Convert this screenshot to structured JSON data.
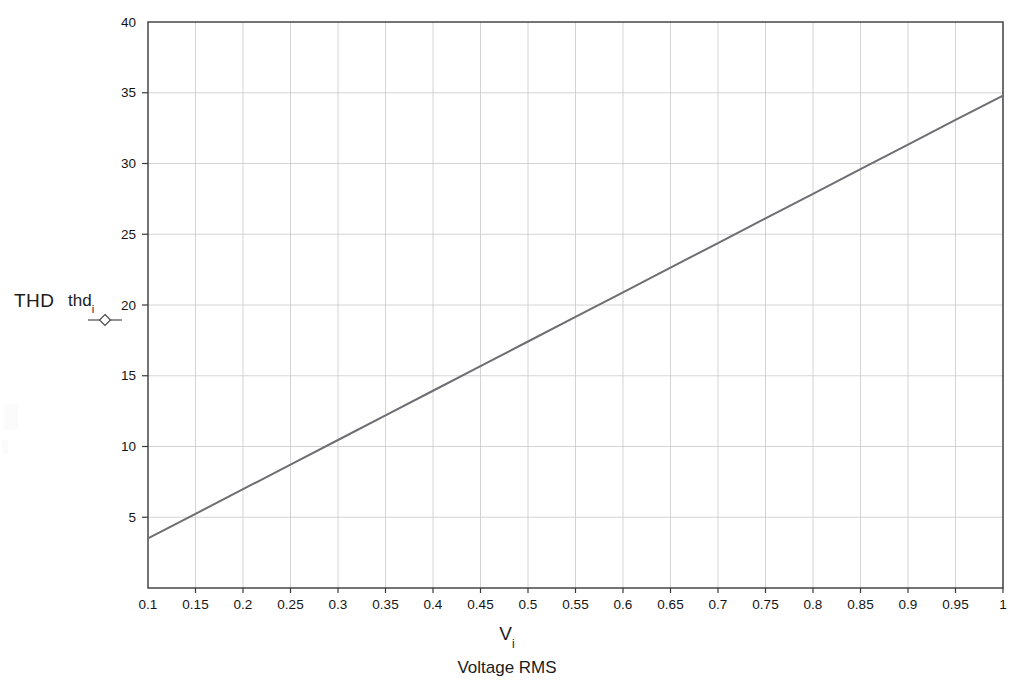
{
  "figure": {
    "background_color": "#ffffff",
    "frame_color": "#3a3a3a",
    "grid_color": "#c9c9c9",
    "line_color": "#6e6e72"
  },
  "axis_labels": {
    "y_main": "THD",
    "y_series": "thd",
    "y_series_sub": "i",
    "x_symbol": "V",
    "x_symbol_sub": "i",
    "x_description": "Voltage RMS"
  },
  "legend": {
    "marker_icon": "diamond-line-marker",
    "series_label": "thd"
  },
  "chart_data": {
    "type": "line",
    "title": "",
    "xlabel": "Vi  Voltage RMS",
    "ylabel": "THD  thdi",
    "xlim": [
      0.1,
      1.0
    ],
    "ylim": [
      0,
      40
    ],
    "grid": true,
    "legend_position": "left-outside",
    "x_ticks": [
      "0.1",
      "0.15",
      "0.2",
      "0.25",
      "0.3",
      "0.35",
      "0.4",
      "0.45",
      "0.5",
      "0.55",
      "0.6",
      "0.65",
      "0.7",
      "0.75",
      "0.8",
      "0.85",
      "0.9",
      "0.95",
      "1"
    ],
    "x_tick_values": [
      0.1,
      0.15,
      0.2,
      0.25,
      0.3,
      0.35,
      0.4,
      0.45,
      0.5,
      0.55,
      0.6,
      0.65,
      0.7,
      0.75,
      0.8,
      0.85,
      0.9,
      0.95,
      1.0
    ],
    "y_ticks": [
      "5",
      "10",
      "15",
      "20",
      "25",
      "30",
      "35",
      "40"
    ],
    "y_tick_values": [
      5,
      10,
      15,
      20,
      25,
      30,
      35,
      40
    ],
    "series": [
      {
        "name": "thd_i",
        "marker": "diamond",
        "x": [
          0.1,
          0.15,
          0.2,
          0.25,
          0.3,
          0.35,
          0.4,
          0.45,
          0.5,
          0.55,
          0.6,
          0.65,
          0.7,
          0.75,
          0.8,
          0.85,
          0.9,
          0.95,
          1.0
        ],
        "values": [
          3.5,
          5.24,
          6.98,
          8.72,
          10.46,
          12.2,
          13.94,
          15.68,
          17.42,
          19.16,
          20.9,
          22.64,
          24.38,
          26.12,
          27.86,
          29.6,
          31.34,
          33.08,
          34.8
        ]
      }
    ]
  }
}
